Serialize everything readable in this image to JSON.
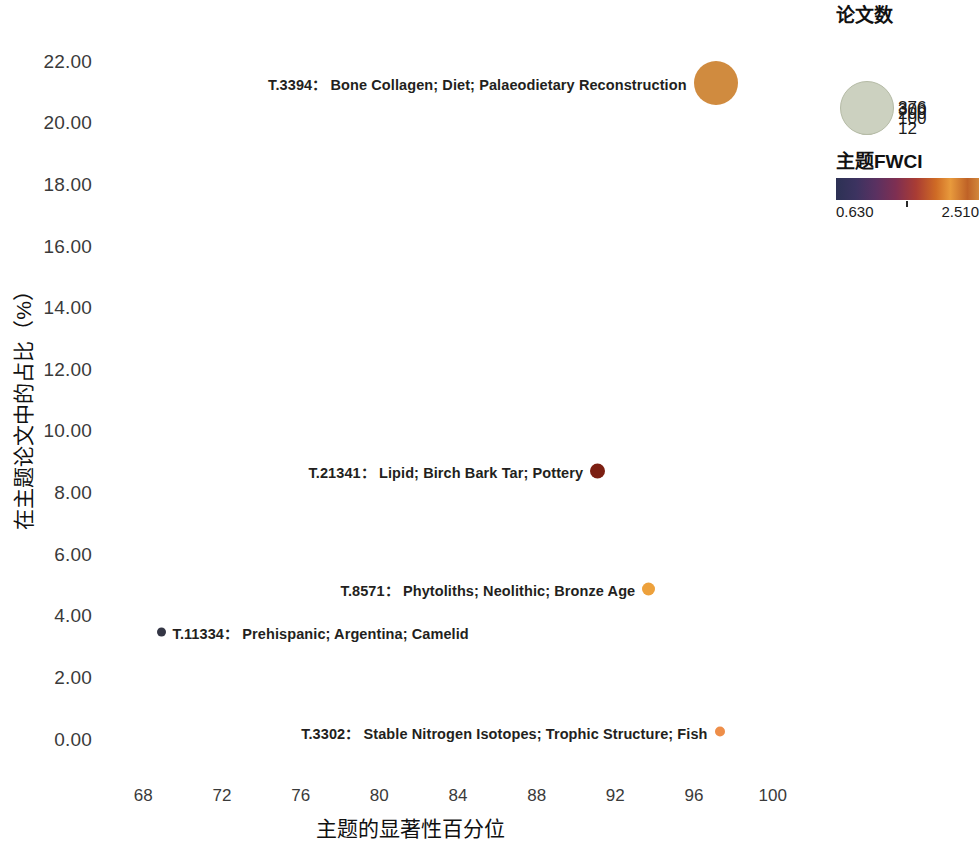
{
  "chart_data": {
    "type": "scatter",
    "title": "",
    "xlabel": "主题的显著性百分位",
    "ylabel": "在主题论文中的占比（%）",
    "xlim": [
      66,
      102
    ],
    "ylim": [
      -0.6,
      22.8
    ],
    "xticks": [
      68,
      72,
      76,
      80,
      84,
      88,
      92,
      96,
      100
    ],
    "xtick_labels": [
      "68",
      "72",
      "76",
      "80",
      "84",
      "88",
      "92",
      "96",
      "100"
    ],
    "yticks": [
      0,
      2,
      4,
      6,
      8,
      10,
      12,
      14,
      16,
      18,
      20,
      22
    ],
    "ytick_labels": [
      "0.00",
      "2.00",
      "4.00",
      "6.00",
      "8.00",
      "10.00",
      "12.00",
      "14.00",
      "16.00",
      "18.00",
      "20.00",
      "22.00"
    ],
    "grid": false,
    "size_encodes": "论文数",
    "color_encodes": "主题FWCI",
    "points": [
      {
        "id": "T.3394",
        "label": "T.3394：  Bone Collagen; Diet; Palaeodietary Reconstruction",
        "keywords": "Bone Collagen; Diet; Palaeodietary Reconstruction",
        "x": 97.1,
        "y": 21.3,
        "papers": 376,
        "fwci": 2.14,
        "color": "#d08b3f",
        "radius_px": 22,
        "label_side": "left"
      },
      {
        "id": "T.21341",
        "label": "T.21341：  Lipid; Birch Bark Tar; Pottery",
        "keywords": "Lipid; Birch Bark Tar; Pottery",
        "x": 91.1,
        "y": 8.7,
        "papers": 52,
        "fwci": 0.85,
        "color": "#7c1f12",
        "radius_px": 7.5,
        "label_side": "left"
      },
      {
        "id": "T.8571",
        "label": "T.8571：  Phytoliths; Neolithic; Bronze Age",
        "keywords": "Phytoliths; Neolithic; Bronze Age",
        "x": 93.7,
        "y": 4.9,
        "papers": 40,
        "fwci": 1.93,
        "color": "#eda13c",
        "radius_px": 6.5,
        "label_side": "left"
      },
      {
        "id": "T.11334",
        "label": "T.11334：  Prehispanic; Argentina; Camelid",
        "keywords": "Prehispanic; Argentina; Camelid",
        "x": 68.9,
        "y": 3.5,
        "papers": 12,
        "fwci": 0.63,
        "color": "#343645",
        "radius_px": 4.5,
        "label_side": "right"
      },
      {
        "id": "T.3302",
        "label": "T.3302：  Stable Nitrogen Isotopes; Trophic Structure; Fish",
        "keywords": "Stable Nitrogen Isotopes; Trophic Structure; Fish",
        "x": 97.3,
        "y": 0.25,
        "papers": 20,
        "fwci": 1.8,
        "color": "#ee8e49",
        "radius_px": 5,
        "label_side": "left"
      }
    ]
  },
  "size_legend": {
    "title": "论文数",
    "items": [
      {
        "label": "12",
        "radius_px": 4.5
      },
      {
        "label": "100",
        "radius_px": 15
      },
      {
        "label": "200",
        "radius_px": 20
      },
      {
        "label": "300",
        "radius_px": 23.5
      },
      {
        "label": "376",
        "radius_px": 26
      }
    ],
    "swatch_color": "#ccd1c0"
  },
  "color_legend": {
    "title": "主题FWCI",
    "min_label": "0.630",
    "max_label": "2.510",
    "min_value": 0.63,
    "max_value": 2.51,
    "gradient_stops": [
      "#2c3154",
      "#5a3161",
      "#a93c34",
      "#cf6b25",
      "#e89a3c",
      "#bf6227",
      "#d2873b"
    ]
  }
}
